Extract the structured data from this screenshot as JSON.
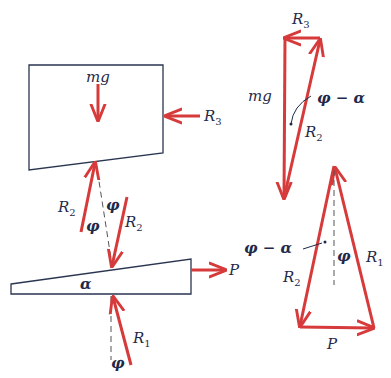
{
  "diagram": {
    "colors": {
      "force": "#d63a3a",
      "outline": "#2a3550",
      "text": "#1f2a4a",
      "dashed": "#555555"
    },
    "block": {
      "weight_label": "mg",
      "side_force": {
        "name": "R",
        "sub": "3"
      }
    },
    "contact_upper": {
      "left_force": {
        "name": "R",
        "sub": "2"
      },
      "right_force": {
        "name": "R",
        "sub": "2"
      },
      "angle_left": "φ",
      "angle_right": "φ"
    },
    "wedge": {
      "angle_label": "α",
      "push_force": "P"
    },
    "contact_lower": {
      "force": {
        "name": "R",
        "sub": "1"
      },
      "angle": "φ"
    },
    "polygon_block": {
      "top": {
        "name": "R",
        "sub": "3"
      },
      "left": "mg",
      "diagonal": {
        "name": "R",
        "sub": "2"
      },
      "angle": "φ − α"
    },
    "polygon_wedge": {
      "angle_left": "φ − α",
      "angle_center": "φ",
      "left": {
        "name": "R",
        "sub": "2"
      },
      "right": {
        "name": "R",
        "sub": "1"
      },
      "bottom": "P"
    }
  }
}
